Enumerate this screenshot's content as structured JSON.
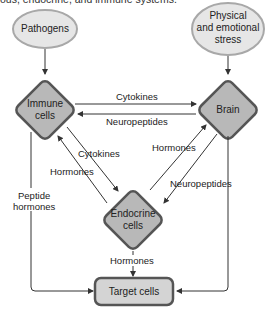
{
  "caption": "ous, endocrine, and immune systems.",
  "colors": {
    "ellipse_fill": "#e6e6e6",
    "ellipse_stroke": "#a8a8a8",
    "diamond_fill": "#b8b8b8",
    "diamond_stroke": "#555555",
    "target_fill": "#d4d4d4",
    "target_stroke": "#555555",
    "line": "#333333"
  },
  "nodes": {
    "pathogens": "Pathogens",
    "stress_line1": "Physical",
    "stress_line2": "and emotional",
    "stress_line3": "stress",
    "immune_line1": "Immune",
    "immune_line2": "cells",
    "brain": "Brain",
    "endocrine_line1": "Endocrine",
    "endocrine_line2": "cells",
    "target": "Target cells"
  },
  "edges": {
    "immune_to_brain": "Cytokines",
    "brain_to_immune": "Neuropeptides",
    "immune_to_endocrine": "Cytokines",
    "endocrine_to_immune": "Hormones",
    "endocrine_to_brain": "Hormones",
    "brain_to_endocrine": "Neuropeptides",
    "endocrine_to_target": "Hormones",
    "immune_to_target_line1": "Peptide",
    "immune_to_target_line2": "hormones"
  }
}
